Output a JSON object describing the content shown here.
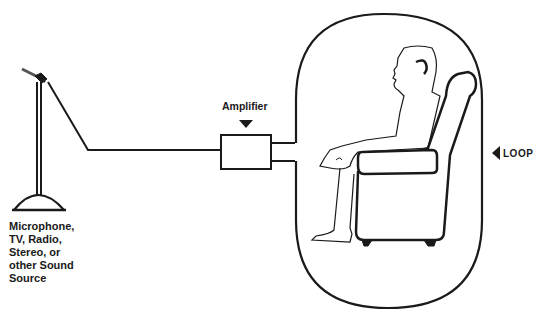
{
  "diagram": {
    "nodes": [
      {
        "id": "source",
        "label_lines": [
          "Microphone,",
          "TV, Radio,",
          "Stereo, or",
          "other Sound",
          "Source"
        ],
        "icon": "microphone-stand-icon"
      },
      {
        "id": "amplifier",
        "label": "Amplifier",
        "icon": "amplifier-box"
      },
      {
        "id": "loop",
        "label": "LOOP",
        "icon": "loop-oval"
      },
      {
        "id": "listener",
        "label": "",
        "icon": "seated-person-with-hearing-aid"
      }
    ],
    "edges": [
      {
        "from": "source",
        "to": "amplifier",
        "type": "wire"
      },
      {
        "from": "amplifier",
        "to": "loop",
        "type": "wire-pair"
      }
    ],
    "colors": {
      "line": "#1a1a1a",
      "background": "#ffffff"
    }
  }
}
